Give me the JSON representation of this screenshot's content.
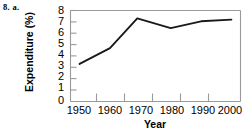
{
  "figure": {
    "problem_label": "8. a."
  },
  "chart_data": {
    "type": "line",
    "title": "",
    "xlabel": "Year",
    "ylabel": "Expenditure (%)",
    "x": [
      1950,
      1960,
      1969,
      1980,
      1990,
      2000
    ],
    "values": [
      3.3,
      4.7,
      7.3,
      6.45,
      7.05,
      7.2
    ],
    "series": [
      {
        "name": "Expenditure",
        "values": [
          3.3,
          4.7,
          7.3,
          6.45,
          7.05,
          7.2
        ]
      }
    ],
    "xlim": [
      1947,
      2003
    ],
    "ylim": [
      0,
      8
    ],
    "xticks": [
      1950,
      1960,
      1970,
      1980,
      1990,
      2000
    ],
    "xtick_labels": [
      "1950",
      "1960",
      "1970",
      "1980",
      "1990",
      "2000"
    ],
    "yticks": [
      0,
      1,
      2,
      3,
      4,
      5,
      6,
      7,
      8
    ],
    "ytick_labels": [
      "0",
      "1",
      "2",
      "3",
      "4",
      "5",
      "6",
      "7",
      "8"
    ],
    "grid": false,
    "legend": "none",
    "line_color": "#1a1a1a",
    "axis_color": "#9a9a9a"
  }
}
